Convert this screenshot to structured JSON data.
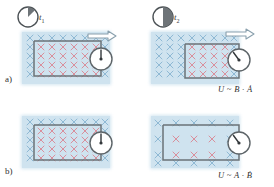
{
  "figure": {
    "background": "#ffffff"
  },
  "colors": {
    "field_region": "#cfe3ef",
    "cross_inside": "#d98f9c",
    "cross_outside": "#8fb9d4",
    "wire": "#6b7378",
    "meter_face": "#ffffff",
    "meter_edge": "#5d6468",
    "arrow_fill": "#ffffff",
    "arrow_edge": "#8aa0ad",
    "text": "#2f2f2f",
    "clock_fill": "#6e7478",
    "clock_edge": "#4c5256"
  },
  "rows": [
    {
      "key": "a",
      "label": "a)",
      "formula": "U ~ B · Ȧ",
      "description": "Loop pulled out of a constant magnetic field; area enclosed changes",
      "panels": [
        {
          "key": "a1",
          "time": {
            "symbol": "t",
            "subscript": "1",
            "label": "t₁",
            "clock_fraction": 0.17
          },
          "field_strength": "strong",
          "cross_rows": 7,
          "cross_cols": 8,
          "loop_inside_fraction": 1.0,
          "motion_arrow": true,
          "arrow_direction": "right",
          "meter_needle_deg": 0
        },
        {
          "key": "a2",
          "time": {
            "symbol": "t",
            "subscript": "2",
            "label": "t₂",
            "clock_fraction": 0.5
          },
          "field_strength": "strong",
          "cross_rows": 7,
          "cross_cols": 8,
          "loop_inside_fraction": 0.55,
          "motion_arrow": true,
          "arrow_direction": "right",
          "meter_needle_deg": -32
        }
      ]
    },
    {
      "key": "b",
      "label": "b)",
      "formula": "U ~ A · Ḃ",
      "description": "Stationary loop in a decreasing magnetic field; field magnitude changes",
      "panels": [
        {
          "key": "b1",
          "time": null,
          "field_strength": "strong",
          "cross_rows": 7,
          "cross_cols": 8,
          "loop_inside_fraction": 1.0,
          "motion_arrow": false,
          "arrow_direction": null,
          "meter_needle_deg": 0
        },
        {
          "key": "b2",
          "time": null,
          "field_strength": "weak",
          "cross_rows": 4,
          "cross_cols": 5,
          "loop_inside_fraction": 1.0,
          "motion_arrow": false,
          "arrow_direction": null,
          "meter_needle_deg": -32
        }
      ]
    }
  ],
  "icons": {
    "clock": "clock-icon",
    "meter": "galvanometer-icon",
    "arrow": "motion-arrow-icon",
    "cross": "field-into-page-cross-icon"
  }
}
